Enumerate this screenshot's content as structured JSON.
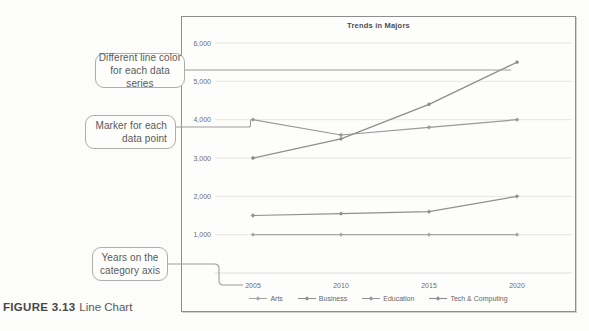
{
  "figure": {
    "caption_label": "FIGURE 3.13",
    "caption_title": "Line Chart"
  },
  "annotations": [
    {
      "text": "Different line color\nfor each data series"
    },
    {
      "text": "Marker for each\ndata point"
    },
    {
      "text": "Years on the\ncategory axis"
    }
  ],
  "chart_data": {
    "type": "line",
    "title": "Trends in Majors",
    "x": [
      "2005",
      "2010",
      "2015",
      "2020"
    ],
    "xlabel": "",
    "ylabel": "",
    "ylim": [
      0,
      6000
    ],
    "ytick_interval": 1000,
    "ytick_labels": [
      "1,000",
      "2,000",
      "3,000",
      "4,000",
      "5,000",
      "6,000"
    ],
    "grid": true,
    "legend_position": "bottom",
    "marker": "diamond",
    "series": [
      {
        "name": "Arts",
        "values": [
          1000,
          1000,
          1000,
          1000
        ],
        "color": "#a8a8a8"
      },
      {
        "name": "Business",
        "values": [
          1500,
          1550,
          1600,
          2000
        ],
        "color": "#8f8f8f"
      },
      {
        "name": "Education",
        "values": [
          4000,
          3600,
          3800,
          4000
        ],
        "color": "#999999"
      },
      {
        "name": "Tech & Computing",
        "values": [
          3000,
          3500,
          4400,
          5500
        ],
        "color": "#8d8d8d"
      }
    ]
  }
}
